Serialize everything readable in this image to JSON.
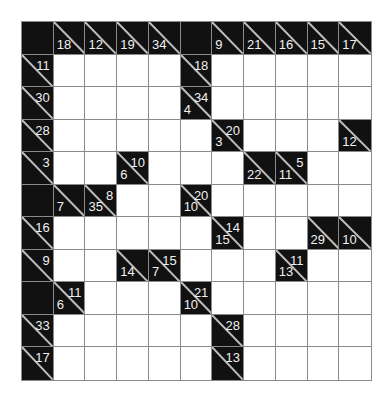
{
  "puzzle": {
    "type": "kakuro",
    "rows": 11,
    "cols": 11,
    "legend": "Each cell: B = blank black, W = white entry cell, or clue object {d: down-sum, r: right-sum}",
    "grid": [
      [
        "B",
        {
          "d": 18
        },
        {
          "d": 12
        },
        {
          "d": 19
        },
        {
          "d": 34
        },
        "B",
        {
          "d": 9
        },
        {
          "d": 21
        },
        {
          "d": 16
        },
        {
          "d": 15
        },
        {
          "d": 17
        }
      ],
      [
        {
          "r": 11
        },
        "W",
        "W",
        "W",
        "W",
        {
          "r": 18
        },
        "W",
        "W",
        "W",
        "W",
        "W"
      ],
      [
        {
          "r": 30
        },
        "W",
        "W",
        "W",
        "W",
        {
          "r": 34,
          "d": 4
        },
        "W",
        "W",
        "W",
        "W",
        "W"
      ],
      [
        {
          "r": 28
        },
        "W",
        "W",
        "W",
        "W",
        "W",
        {
          "r": 20,
          "d": 3
        },
        "W",
        "W",
        "W",
        {
          "d": 12
        }
      ],
      [
        {
          "r": 3
        },
        "W",
        "W",
        {
          "r": 10,
          "d": 6
        },
        "W",
        "W",
        "W",
        {
          "d": 22
        },
        {
          "r": 5,
          "d": 11
        },
        "W",
        "W"
      ],
      [
        "B",
        {
          "d": 7
        },
        {
          "r": 8,
          "d": 35
        },
        "W",
        "W",
        {
          "r": 20,
          "d": 10
        },
        "W",
        "W",
        "W",
        "W",
        "W"
      ],
      [
        {
          "r": 16
        },
        "W",
        "W",
        "W",
        "W",
        "W",
        {
          "r": 14,
          "d": 15
        },
        "W",
        "W",
        {
          "d": 29
        },
        {
          "d": 10
        }
      ],
      [
        {
          "r": 9
        },
        "W",
        "W",
        {
          "d": 14
        },
        {
          "r": 15,
          "d": 7
        },
        "W",
        "W",
        "W",
        {
          "r": 11,
          "d": 13
        },
        "W",
        "W"
      ],
      [
        "B",
        {
          "r": 11,
          "d": 6
        },
        "W",
        "W",
        "W",
        {
          "r": 21,
          "d": 10
        },
        "W",
        "W",
        "W",
        "W",
        "W"
      ],
      [
        {
          "r": 33
        },
        "W",
        "W",
        "W",
        "W",
        "W",
        {
          "r": 28
        },
        "W",
        "W",
        "W",
        "W"
      ],
      [
        {
          "r": 17
        },
        "W",
        "W",
        "W",
        "W",
        "W",
        {
          "r": 13
        },
        "W",
        "W",
        "W",
        "W"
      ]
    ]
  },
  "colors": {
    "black_cell": "#111111",
    "white_cell": "#ffffff",
    "grid_line": "#8a8a8a",
    "clue_text": "#f0f0f0"
  }
}
